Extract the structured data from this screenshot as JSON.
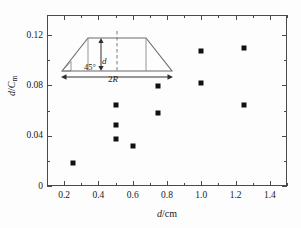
{
  "chart_data": {
    "type": "scatter",
    "title": "",
    "xlabel": "d/cm",
    "ylabel": "d/Cm",
    "xlim": [
      0.1,
      1.5
    ],
    "ylim": [
      0,
      0.136
    ],
    "grid": false,
    "legend_position": "none",
    "marker": "filled-square",
    "marker_color": "#111111",
    "x_ticks": [
      "0.2",
      "0.4",
      "0.6",
      "0.8",
      "1.0",
      "1.2",
      "1.4"
    ],
    "x_tick_values": [
      0.2,
      0.4,
      0.6,
      0.8,
      1.0,
      1.2,
      1.4
    ],
    "x_minor_step": 0.1,
    "y_ticks": [
      "0",
      "0.04",
      "0.08",
      "0.12"
    ],
    "y_tick_values": [
      0,
      0.04,
      0.08,
      0.12
    ],
    "y_minor_step": 0.02,
    "points": [
      {
        "x": 0.25,
        "y": 0.018
      },
      {
        "x": 0.5,
        "y": 0.0645
      },
      {
        "x": 0.5,
        "y": 0.0485
      },
      {
        "x": 0.5,
        "y": 0.037
      },
      {
        "x": 0.6,
        "y": 0.0315
      },
      {
        "x": 0.75,
        "y": 0.0795
      },
      {
        "x": 0.75,
        "y": 0.058
      },
      {
        "x": 1.0,
        "y": 0.107
      },
      {
        "x": 1.0,
        "y": 0.082
      },
      {
        "x": 1.25,
        "y": 0.11
      },
      {
        "x": 1.25,
        "y": 0.0645
      }
    ]
  },
  "axes": {
    "x_title_italic": "d",
    "x_title_rest": "/cm",
    "y_title_italic_1": "d",
    "y_title_slash": "/",
    "y_title_italic_2": "C",
    "y_title_sub": "m"
  },
  "inset": {
    "angle_label": "45°",
    "height_label": "d",
    "base_label_number": "2",
    "base_label_italic": "R",
    "shape": "trapezoid",
    "centerline": "dashed"
  }
}
